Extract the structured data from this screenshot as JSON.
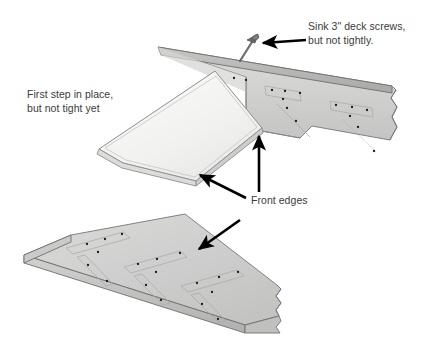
{
  "figure": {
    "background_color": "#ffffff"
  },
  "palette": {
    "board_face": "#cfcfcd",
    "board_face_light": "#d8d8d6",
    "board_top_edge": "#b2b2b0",
    "board_shadow_edge": "#9a9a98",
    "step_face": "#f2f2f0",
    "step_edge": "#c9c9c7",
    "outline": "#6f6f6f",
    "screw_body": "#5c5c5c",
    "screw_hole": "#1a1a1a",
    "arrow": "#000000",
    "text": "#3b3b3b"
  },
  "callouts": [
    {
      "id": "screws",
      "name": "callout-sink-screws",
      "lines": [
        "Sink 3\" deck screws,",
        "but not tightly."
      ],
      "text": "Sink 3\" deck screws,\nbut not tightly.",
      "x": 308,
      "y": 20,
      "arrow_count": 1
    },
    {
      "id": "first-step",
      "name": "callout-first-step",
      "lines": [
        "First step in place,",
        "but not tight yet"
      ],
      "text": "First step in place,\nbut not tight yet",
      "x": 27,
      "y": 88,
      "arrow_count": 0
    },
    {
      "id": "front-edges",
      "name": "callout-front-edges",
      "lines": [
        "Front edges"
      ],
      "text": "Front edges",
      "x": 251,
      "y": 194,
      "arrow_count": 3
    }
  ],
  "parts": [
    {
      "id": "stringer",
      "name": "stringer-board",
      "description": "Upper diagonal stringer board with notched front face",
      "screw_dot_count": 13,
      "has_break_line": true
    },
    {
      "id": "first-step",
      "name": "first-step-board",
      "description": "First step tread shown in light tone, angled down-left",
      "screw_dot_count": 0,
      "has_break_line": false
    },
    {
      "id": "lower-board",
      "name": "lower-stringer-board",
      "description": "Lower stringer board lying flat with screw layout marks",
      "screw_dot_count": 15,
      "has_break_line": true
    }
  ],
  "fastener": {
    "name": "deck-screw",
    "label": "3\" deck screw",
    "size": "3\""
  },
  "arrows": [
    {
      "name": "arrow-to-screw",
      "from": [
        305,
        40
      ],
      "to": [
        258,
        44
      ],
      "points_at": "deck-screw"
    },
    {
      "name": "arrow-to-joint",
      "from": [
        259,
        190
      ],
      "to": [
        259,
        131
      ],
      "points_at": "stringer-front-edge"
    },
    {
      "name": "arrow-to-step-edge",
      "from": [
        243,
        196
      ],
      "to": [
        196,
        172
      ],
      "points_at": "first-step-front-edge"
    },
    {
      "name": "arrow-to-lower-board",
      "from": [
        237,
        222
      ],
      "to": [
        195,
        252
      ],
      "points_at": "lower-board-front-edge"
    }
  ]
}
